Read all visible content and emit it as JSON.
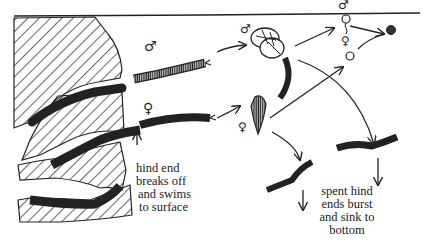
{
  "diagram": {
    "labels": {
      "hind_end_breaks": [
        "hind end",
        "breaks off",
        "and swims",
        "to surface"
      ],
      "spent_hind_ends": [
        "spent hind",
        "ends burst",
        "and sink to",
        "bottom"
      ]
    },
    "symbols": {
      "male": "♂",
      "female": "♀"
    },
    "stages": [
      "worms in rock burrows",
      "male hind end (dark)",
      "female hind end (light)",
      "coiled male releasing sperm",
      "female releasing eggs",
      "sperm at surface",
      "egg",
      "fertilized egg",
      "spent hind ends sinking"
    ],
    "colors": {
      "ink": "#222222",
      "paper": "#ffffff"
    }
  }
}
